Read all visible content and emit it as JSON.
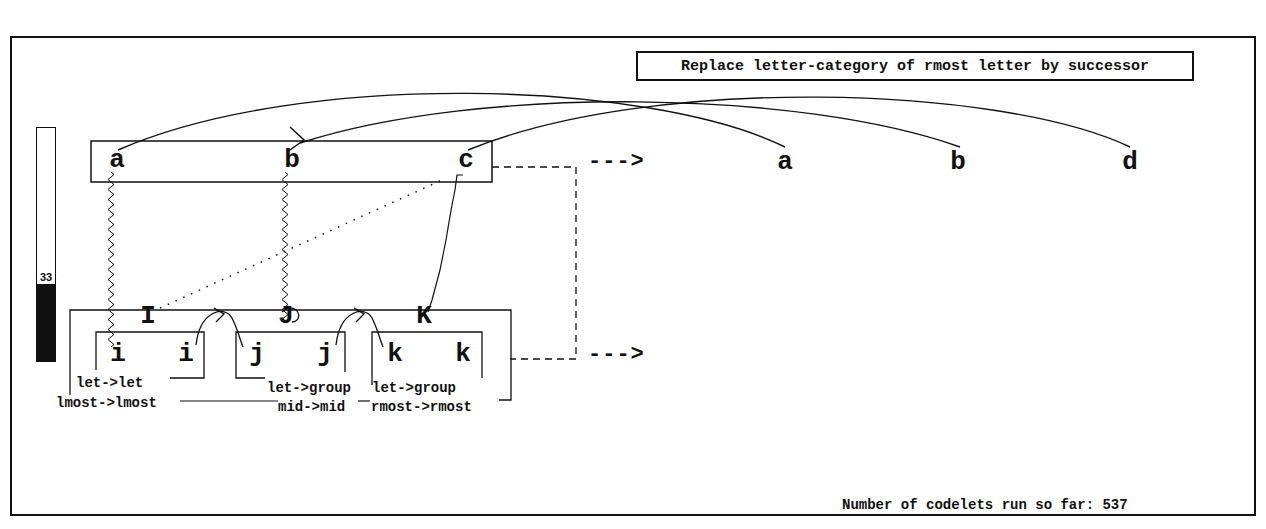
{
  "rule": {
    "text": "Replace letter-category of rmost letter by successor"
  },
  "status": {
    "codelets_text": "Number of codelets run so far: 537",
    "codelets_label": "Number of codelets run so far:",
    "codelets_count": 537
  },
  "temperature": {
    "value": 33,
    "label": "33",
    "max": 100,
    "fill_color": "#111111"
  },
  "initial_string": {
    "letters": [
      "a",
      "b",
      "c"
    ]
  },
  "modified_string": {
    "letters": [
      "a",
      "b",
      "d"
    ]
  },
  "target_string": {
    "letters": [
      "i",
      "i",
      "j",
      "j",
      "k",
      "k"
    ],
    "group_letters": [
      "I",
      "J",
      "K"
    ]
  },
  "arrows": {
    "top": "--->",
    "bottom": "--->"
  },
  "correspondence_labels": {
    "group_i": [
      "let->let",
      "lmost->lmost"
    ],
    "group_j": [
      "let->group",
      "mid->mid"
    ],
    "group_k": [
      "let->group",
      "rmost->rmost"
    ]
  }
}
